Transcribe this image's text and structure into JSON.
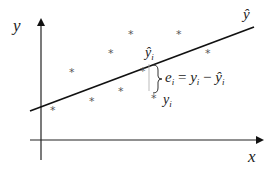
{
  "diagram": {
    "axes": {
      "x_label": "x",
      "y_label": "y"
    },
    "regression_line": {
      "label": "ŷ",
      "start": [
        30,
        111
      ],
      "end": [
        254,
        27
      ]
    },
    "points": [
      {
        "x": 53,
        "y": 109
      },
      {
        "x": 72,
        "y": 71
      },
      {
        "x": 92,
        "y": 100
      },
      {
        "x": 111,
        "y": 52
      },
      {
        "x": 121,
        "y": 90
      },
      {
        "x": 131,
        "y": 33
      },
      {
        "x": 143,
        "y": 70
      },
      {
        "x": 179,
        "y": 33
      },
      {
        "x": 208,
        "y": 52
      }
    ],
    "highlighted_point": {
      "x": 156,
      "y": 95,
      "label_observed": "y",
      "label_observed_sub": "i",
      "label_fitted": "ŷ",
      "label_fitted_sub": "i"
    },
    "residual": {
      "equation_parts": [
        "e",
        "i",
        " = y",
        "i",
        " − ŷ",
        "i"
      ],
      "lhs": "e",
      "lhs_sub": "i",
      "eq": " = ",
      "term1": "y",
      "term1_sub": "i",
      "minus": " − ",
      "term2": "ŷ",
      "term2_sub": "i"
    },
    "colors": {
      "line": "#111111",
      "axis": "#222222",
      "point": "#555555",
      "guide": "#aaaaaa"
    }
  }
}
